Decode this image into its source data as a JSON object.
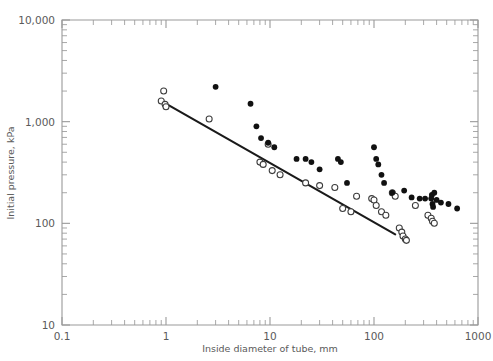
{
  "chart_data": {
    "type": "scatter",
    "title": "",
    "xlabel": "Inside diameter of tube, mm",
    "ylabel": "Initial pressure, kPa",
    "xscale": "log",
    "yscale": "log",
    "xlim": [
      0.1,
      1000
    ],
    "ylim": [
      10,
      10000
    ],
    "grid": false,
    "legend": "none",
    "x_tick_labels": [
      "0.1",
      "1",
      "10",
      "100",
      "1000"
    ],
    "x_tick_values": [
      0.1,
      1,
      10,
      100,
      1000
    ],
    "y_tick_labels": [
      "10",
      "100",
      "1,000",
      "10,000"
    ],
    "y_tick_values": [
      10,
      100,
      1000,
      10000
    ],
    "series": [
      {
        "name": "open-circles",
        "marker": "open circle",
        "color": "#ffffff",
        "edge_color": "#3c3c3c",
        "points": [
          [
            0.9,
            1600
          ],
          [
            0.95,
            2000
          ],
          [
            0.98,
            1480
          ],
          [
            1.0,
            1400
          ],
          [
            2.6,
            1060
          ],
          [
            8.0,
            400
          ],
          [
            8.6,
            380
          ],
          [
            9.6,
            600
          ],
          [
            10.5,
            330
          ],
          [
            12.5,
            300
          ],
          [
            22.0,
            250
          ],
          [
            30.0,
            235
          ],
          [
            42.0,
            225
          ],
          [
            50.0,
            140
          ],
          [
            60.0,
            130
          ],
          [
            68.0,
            185
          ],
          [
            95.0,
            175
          ],
          [
            100.0,
            170
          ],
          [
            105.0,
            150
          ],
          [
            118.0,
            130
          ],
          [
            130.0,
            120
          ],
          [
            150.0,
            200
          ],
          [
            160.0,
            185
          ],
          [
            175.0,
            90
          ],
          [
            185.0,
            82
          ],
          [
            190.0,
            75
          ],
          [
            200.0,
            70
          ],
          [
            205.0,
            68
          ],
          [
            250.0,
            150
          ],
          [
            330.0,
            120
          ],
          [
            355.0,
            112
          ],
          [
            365.0,
            105
          ],
          [
            380.0,
            100
          ]
        ]
      },
      {
        "name": "filled-circles",
        "marker": "filled circle",
        "color": "#111111",
        "edge_color": "#111111",
        "points": [
          [
            3.0,
            2200
          ],
          [
            6.5,
            1500
          ],
          [
            7.4,
            900
          ],
          [
            8.2,
            690
          ],
          [
            9.6,
            620
          ],
          [
            11.0,
            560
          ],
          [
            18.0,
            430
          ],
          [
            22.0,
            430
          ],
          [
            25.0,
            400
          ],
          [
            30.0,
            340
          ],
          [
            45.0,
            430
          ],
          [
            48.0,
            400
          ],
          [
            55.0,
            250
          ],
          [
            100.0,
            560
          ],
          [
            105.0,
            430
          ],
          [
            110.0,
            380
          ],
          [
            118.0,
            300
          ],
          [
            125.0,
            250
          ],
          [
            150.0,
            200
          ],
          [
            195.0,
            210
          ],
          [
            230.0,
            180
          ],
          [
            275.0,
            175
          ],
          [
            310.0,
            175
          ],
          [
            355.0,
            175
          ],
          [
            360.0,
            190
          ],
          [
            365.0,
            155
          ],
          [
            370.0,
            145
          ],
          [
            380.0,
            200
          ],
          [
            400.0,
            170
          ],
          [
            440.0,
            160
          ],
          [
            520.0,
            155
          ],
          [
            630.0,
            140
          ]
        ]
      }
    ],
    "fit_line": {
      "name": "trend-line",
      "color": "#1a1a1a",
      "points": [
        [
          0.95,
          1550
        ],
        [
          160.0,
          78
        ]
      ]
    }
  }
}
